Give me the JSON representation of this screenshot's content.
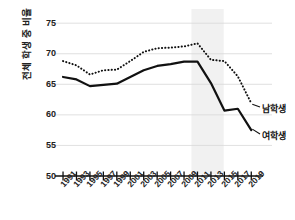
{
  "chart_data": {
    "type": "line",
    "title": "",
    "xlabel": "",
    "ylabel": "전체 학생 중 비율",
    "x": [
      1991,
      1993,
      1995,
      1997,
      1999,
      2001,
      2003,
      2005,
      2007,
      2009,
      2011,
      2013,
      2015,
      2017,
      2019
    ],
    "xtick_labels": [
      "1991",
      "1993",
      "1995",
      "1997",
      "1999",
      "2001",
      "2003",
      "2005",
      "2007",
      "2009",
      "2011",
      "2013",
      "2015",
      "2017",
      "2019"
    ],
    "ytick_labels": [
      "75",
      "70",
      "65",
      "60",
      "55",
      "50"
    ],
    "yticks": [
      75,
      70,
      65,
      60,
      55,
      50
    ],
    "ylim": [
      50,
      76.5
    ],
    "xlim": [
      1990.4,
      2020.0
    ],
    "grid": "horizontal",
    "legend_position": "right-end-labels",
    "series": [
      {
        "name": "남학생",
        "style": "dotted",
        "color": "#111111",
        "values": [
          68.8,
          68.1,
          66.6,
          67.3,
          67.4,
          68.8,
          70.3,
          70.9,
          71.0,
          71.2,
          71.7,
          69.0,
          68.8,
          66.3,
          61.9
        ]
      },
      {
        "name": "여학생",
        "style": "solid",
        "color": "#111111",
        "values": [
          66.2,
          65.8,
          64.7,
          64.9,
          65.1,
          66.2,
          67.3,
          68.0,
          68.3,
          68.7,
          68.7,
          65.2,
          60.7,
          61.0,
          57.5
        ]
      }
    ],
    "shaded_band": {
      "from": 2010.1,
      "to": 2014.9,
      "color": "#f1f1f1",
      "label": ""
    },
    "annotations": []
  },
  "series_labels": [
    {
      "name": "남학생"
    },
    {
      "name": "여학생"
    }
  ]
}
